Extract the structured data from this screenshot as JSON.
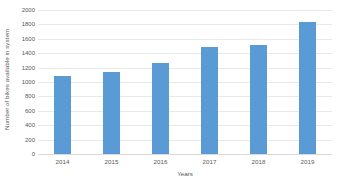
{
  "chart_data": {
    "type": "bar",
    "title": "",
    "subtitle": "",
    "xlabel": "Years",
    "ylabel": "Number of bikes available in system",
    "categories": [
      "2014",
      "2015",
      "2016",
      "2017",
      "2018",
      "2019"
    ],
    "values": [
      1090,
      1140,
      1260,
      1480,
      1520,
      1830
    ],
    "series": [
      {
        "name": "Number of bikes available in system",
        "values": [
          1090,
          1140,
          1260,
          1480,
          1520,
          1830
        ],
        "color": "#5b9bd5"
      }
    ],
    "ylim": [
      0,
      2000
    ],
    "ytick_step": 200,
    "ytick_labels": [
      "0",
      "200",
      "400",
      "600",
      "800",
      "1000",
      "1200",
      "1400",
      "1600",
      "1800",
      "2000"
    ],
    "ytick_values": [
      0,
      200,
      400,
      600,
      800,
      1000,
      1200,
      1400,
      1600,
      1800,
      2000
    ],
    "grid": true,
    "grid_axis": "y",
    "legend": false,
    "legend_position": "none",
    "annotations": [],
    "colors": {
      "bar": "#5b9bd5",
      "gridline": "#e8e8e8",
      "baseline": "#d9d9d9",
      "text": "#595959",
      "background": "#ffffff"
    }
  },
  "axes": {
    "y_title": "Number of bikes available in system",
    "x_title": "Years"
  }
}
